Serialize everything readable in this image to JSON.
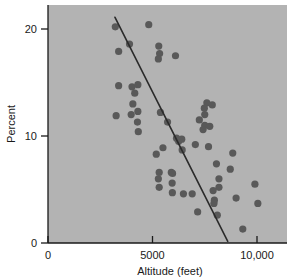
{
  "chart_data": {
    "type": "scatter",
    "title": "",
    "subtitle": "",
    "xlabel": "Altitude (feet)",
    "ylabel": "Percent",
    "xlim": [
      0,
      10600
    ],
    "ylim": [
      0,
      22
    ],
    "xticks": [
      0,
      5000,
      10000
    ],
    "xticklabels": [
      "0",
      "5000",
      "10,000"
    ],
    "yticks": [
      0,
      10,
      20
    ],
    "yticklabels": [
      "0",
      "10",
      "20"
    ],
    "grid": false,
    "legend": null,
    "plot_background_color": "#b3b3b3",
    "point_color": "#595959",
    "line_color": "#2b2b2b",
    "axis_color": "#1a1a1a",
    "series": [
      {
        "name": "observations",
        "marker": "circle",
        "points": [
          [
            3220,
            20.2
          ],
          [
            3900,
            18.6
          ],
          [
            3380,
            17.9
          ],
          [
            4820,
            20.4
          ],
          [
            5300,
            18.4
          ],
          [
            5340,
            17.7
          ],
          [
            5280,
            17.2
          ],
          [
            6100,
            17.5
          ],
          [
            3380,
            14.7
          ],
          [
            4020,
            14.6
          ],
          [
            4300,
            14.8
          ],
          [
            4150,
            14.0
          ],
          [
            4060,
            13.0
          ],
          [
            4300,
            12.3
          ],
          [
            3260,
            11.9
          ],
          [
            3980,
            12.0
          ],
          [
            4280,
            11.3
          ],
          [
            4320,
            10.4
          ],
          [
            5380,
            12.2
          ],
          [
            5720,
            11.3
          ],
          [
            6150,
            9.8
          ],
          [
            6250,
            9.5
          ],
          [
            6400,
            9.7
          ],
          [
            6420,
            8.7
          ],
          [
            5500,
            8.9
          ],
          [
            5180,
            8.3
          ],
          [
            7050,
            9.2
          ],
          [
            7680,
            9.0
          ],
          [
            7600,
            13.1
          ],
          [
            7860,
            12.9
          ],
          [
            7480,
            12.6
          ],
          [
            7240,
            11.5
          ],
          [
            7500,
            11.0
          ],
          [
            7420,
            10.6
          ],
          [
            7740,
            10.9
          ],
          [
            7500,
            12.0
          ],
          [
            5320,
            6.6
          ],
          [
            5280,
            6.0
          ],
          [
            5320,
            5.2
          ],
          [
            5900,
            6.6
          ],
          [
            5960,
            6.5
          ],
          [
            5940,
            5.6
          ],
          [
            5950,
            4.7
          ],
          [
            6480,
            4.6
          ],
          [
            6900,
            4.6
          ],
          [
            8060,
            7.4
          ],
          [
            8840,
            8.4
          ],
          [
            8720,
            6.9
          ],
          [
            8180,
            6.0
          ],
          [
            8180,
            5.2
          ],
          [
            7900,
            4.9
          ],
          [
            7960,
            4.0
          ],
          [
            7940,
            3.7
          ],
          [
            8100,
            2.6
          ],
          [
            7160,
            2.9
          ],
          [
            9000,
            4.2
          ],
          [
            9900,
            5.5
          ],
          [
            10040,
            3.7
          ],
          [
            9320,
            1.3
          ]
        ]
      }
    ],
    "trend_line": {
      "type": "linear-fit",
      "x_start": 3200,
      "y_start": 21.1,
      "x_end": 8600,
      "y_end": 0.15
    }
  }
}
